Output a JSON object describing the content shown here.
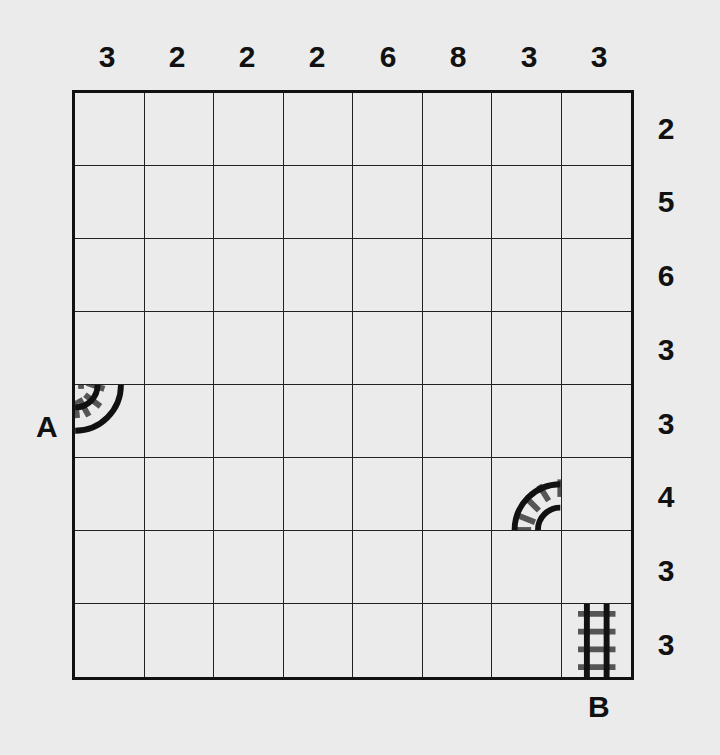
{
  "puzzle": {
    "type": "train-tracks",
    "grid_size": {
      "rows": 8,
      "cols": 8
    },
    "column_clues": [
      "3",
      "2",
      "2",
      "2",
      "6",
      "8",
      "3",
      "3"
    ],
    "row_clues": [
      "2",
      "5",
      "6",
      "3",
      "3",
      "4",
      "3",
      "3"
    ],
    "endpoints": {
      "start": {
        "label": "A",
        "row": 4,
        "col": 0,
        "side": "left"
      },
      "end": {
        "label": "B",
        "row": 7,
        "col": 7,
        "side": "bottom"
      }
    },
    "given_tracks": [
      {
        "row": 4,
        "col": 0,
        "shape": "curve",
        "connects": [
          "left",
          "top"
        ],
        "label": "curve-left-top"
      },
      {
        "row": 5,
        "col": 6,
        "shape": "curve",
        "connects": [
          "bottom",
          "right"
        ],
        "label": "curve-bottom-right"
      },
      {
        "row": 7,
        "col": 7,
        "shape": "straight",
        "connects": [
          "top",
          "bottom"
        ],
        "label": "straight-vertical"
      }
    ]
  },
  "colors": {
    "background": "#ebebeb",
    "ink": "#111111",
    "tie": "#555555"
  }
}
